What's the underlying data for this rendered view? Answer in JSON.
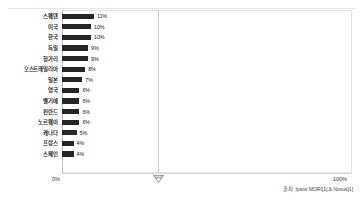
{
  "chart_data": {
    "type": "bar",
    "orientation": "horizontal",
    "title": "",
    "xlabel": "",
    "ylabel": "",
    "xlim": [
      0,
      100
    ],
    "grid": true,
    "gridlines": [
      50
    ],
    "axis_tick_labels": [
      "0%",
      "100%"
    ],
    "categories": [
      "스웨덴",
      "미국",
      "한국",
      "독일",
      "헝가리",
      "오스트레일리아",
      "일본",
      "영국",
      "벨기에",
      "핀란드",
      "노르웨이",
      "캐나다",
      "프랑스",
      "스페인"
    ],
    "values": [
      11,
      10,
      10,
      9,
      9,
      8,
      7,
      6,
      6,
      6,
      6,
      5,
      4,
      4
    ],
    "value_labels": [
      "11%",
      "10%",
      "10%",
      "9%",
      "9%",
      "8%",
      "7%",
      "6%",
      "6%",
      "6%",
      "6%",
      "5%",
      "4%",
      "4%"
    ],
    "bar_color": "#262626"
  },
  "axis": {
    "left_label": "0%",
    "right_label": "100%"
  },
  "footer": {
    "source": "출처: Ipsos MORI[1] & Novus[1]"
  },
  "icons": {
    "axis_marker": "diamond-marker-icon"
  }
}
